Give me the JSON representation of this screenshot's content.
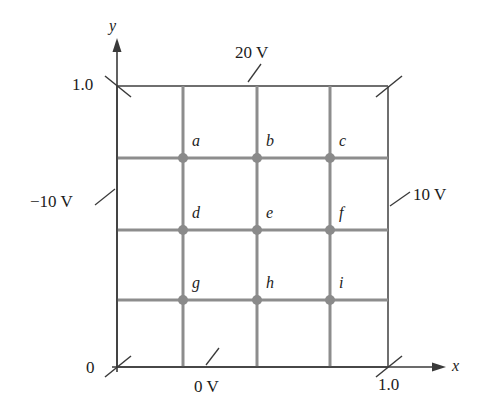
{
  "figure": {
    "domain_label": "potential-grid-diagram"
  },
  "axes": {
    "x_axis_label": "x",
    "y_axis_label": "y",
    "origin_label": "0",
    "y_max_tick_label": "1.0",
    "x_max_tick_label": "1.0",
    "x_range": [
      0,
      1.0
    ],
    "y_range": [
      0,
      1.0
    ]
  },
  "boundary_potentials": {
    "top": "20 V",
    "bottom": "0 V",
    "left": "−10 V",
    "right": "10 V"
  },
  "nodes": [
    {
      "id": "a",
      "label": "a",
      "col": 1,
      "row": 1,
      "cx": 183,
      "cy": 158
    },
    {
      "id": "b",
      "label": "b",
      "col": 2,
      "row": 1,
      "cx": 257,
      "cy": 158
    },
    {
      "id": "c",
      "label": "c",
      "col": 3,
      "row": 1,
      "cx": 330,
      "cy": 158
    },
    {
      "id": "d",
      "label": "d",
      "col": 1,
      "row": 2,
      "cx": 183,
      "cy": 230
    },
    {
      "id": "e",
      "label": "e",
      "col": 2,
      "row": 2,
      "cx": 257,
      "cy": 230
    },
    {
      "id": "f",
      "label": "f",
      "col": 3,
      "row": 2,
      "cx": 330,
      "cy": 230
    },
    {
      "id": "g",
      "label": "g",
      "col": 1,
      "row": 3,
      "cx": 183,
      "cy": 300
    },
    {
      "id": "h",
      "label": "h",
      "col": 2,
      "row": 3,
      "cx": 257,
      "cy": 300
    },
    {
      "id": "i",
      "label": "i",
      "col": 3,
      "row": 3,
      "cx": 330,
      "cy": 300
    }
  ],
  "grid": {
    "rows": 4,
    "cols": 4,
    "box_left": 117,
    "box_right": 388,
    "box_top": 86,
    "box_bottom": 367,
    "vertical_lines_x": [
      183,
      257,
      330
    ],
    "horizontal_lines_y": [
      158,
      230,
      300
    ]
  },
  "colors": {
    "grid_line": "#8d8d8d",
    "box_edge": "#6f6f6f",
    "node_dot": "#8a8a8a",
    "axis": "#3a3a3a",
    "text": "#1c1c1c",
    "background": "#ffffff"
  }
}
